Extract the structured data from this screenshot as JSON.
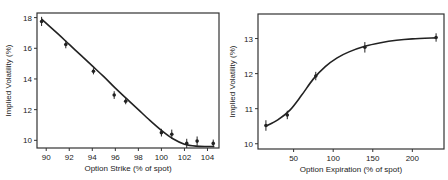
{
  "chart_data": [
    {
      "type": "scatter",
      "title": "",
      "xlabel": "Option Strike (% of spot)",
      "ylabel": "Implied Volatility (%)",
      "xlim": [
        89.2,
        105
      ],
      "ylim": [
        9.5,
        18.3
      ],
      "xticks": [
        90,
        92,
        94,
        96,
        98,
        100,
        102,
        104
      ],
      "yticks": [
        10,
        12,
        14,
        16,
        18
      ],
      "grid": false,
      "legend": null,
      "series": [
        {
          "name": "observed",
          "x": [
            89.6,
            91.7,
            94.1,
            95.9,
            96.9,
            100.0,
            100.9,
            102.2,
            103.1,
            104.5
          ],
          "y": [
            17.75,
            16.25,
            14.5,
            12.95,
            12.55,
            10.5,
            10.4,
            9.8,
            9.95,
            9.8
          ],
          "error": [
            0.3,
            0.25,
            0.2,
            0.25,
            0.2,
            0.25,
            0.3,
            0.3,
            0.3,
            0.25
          ]
        },
        {
          "name": "fit",
          "type": "line",
          "x": [
            89.6,
            91,
            92,
            93,
            94,
            95,
            96,
            97,
            98,
            99,
            100,
            101,
            102,
            103,
            104,
            104.6
          ],
          "y": [
            17.9,
            16.95,
            16.25,
            15.55,
            14.85,
            14.15,
            13.4,
            12.7,
            12.0,
            11.3,
            10.65,
            10.1,
            9.75,
            9.62,
            9.6,
            9.6
          ]
        }
      ]
    },
    {
      "type": "scatter",
      "title": "",
      "xlabel": "Option Expiration (% of spot)",
      "ylabel": "Implied Volatility (%)",
      "xlim": [
        5,
        240
      ],
      "ylim": [
        9.85,
        13.7
      ],
      "xticks": [
        50,
        100,
        150,
        200
      ],
      "yticks": [
        10,
        11,
        12,
        13
      ],
      "grid": false,
      "legend": null,
      "series": [
        {
          "name": "observed",
          "x": [
            15,
            42,
            78,
            140,
            230
          ],
          "y": [
            10.52,
            10.82,
            11.93,
            12.75,
            13.03
          ],
          "error": [
            0.15,
            0.12,
            0.12,
            0.15,
            0.12
          ]
        },
        {
          "name": "fit",
          "type": "line",
          "x": [
            15,
            30,
            45,
            60,
            75,
            90,
            105,
            120,
            140,
            160,
            180,
            200,
            230
          ],
          "y": [
            10.5,
            10.68,
            10.95,
            11.38,
            11.85,
            12.2,
            12.45,
            12.62,
            12.78,
            12.88,
            12.95,
            12.99,
            13.02
          ]
        }
      ]
    }
  ]
}
